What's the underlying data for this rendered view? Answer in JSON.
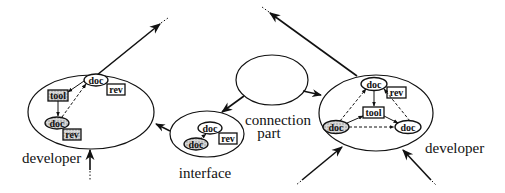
{
  "labels": {
    "developer_left": "developer",
    "developer_right": "developer",
    "interface": "interface",
    "connection_line1": "connection",
    "connection_line2": "part"
  },
  "nodes": {
    "doc": "doc",
    "rev": "rev",
    "tool": "tool"
  },
  "colors": {
    "ink": "#111111",
    "background": "#ffffff",
    "hatch": "#bdbdbd"
  }
}
